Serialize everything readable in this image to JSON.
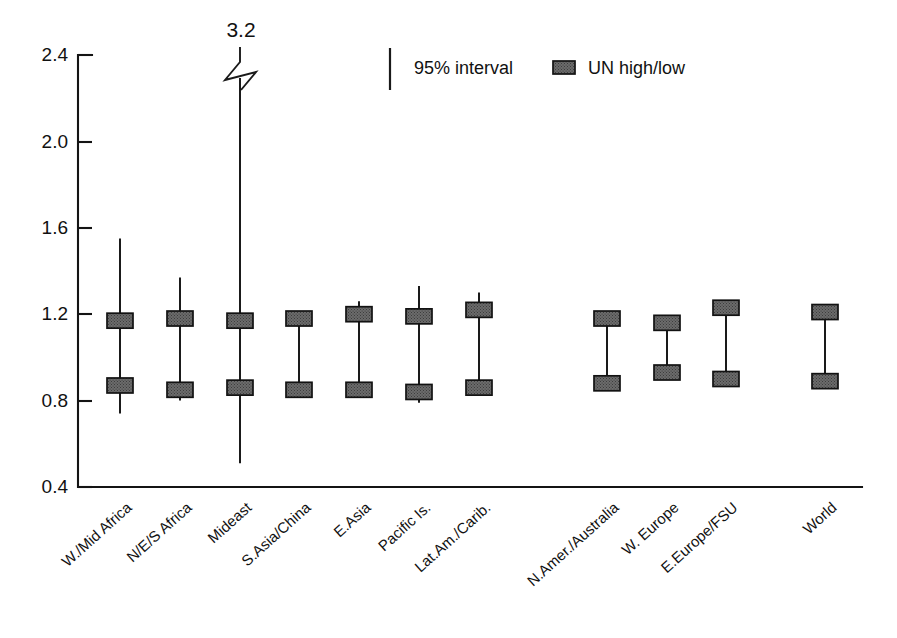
{
  "chart_data": {
    "type": "line",
    "title": "",
    "subtitle": "",
    "xlabel": "",
    "ylabel": "",
    "ylim": [
      0.4,
      2.4
    ],
    "yticks": [
      0.4,
      0.8,
      1.2,
      1.6,
      2.0,
      2.4
    ],
    "ytick_labels": [
      "0.4",
      "0.8",
      "1.2",
      "1.6",
      "2.0",
      "2.4"
    ],
    "grid": false,
    "legend_position": "top-center",
    "annotations": [
      {
        "text": "3.2",
        "category": "Mideast",
        "note": "upper end of 95% interval for Mideast, axis broken with zigzag symbol"
      }
    ],
    "categories": [
      "W./Mid Africa",
      "N/E/S Africa",
      "Mideast",
      "S.Asia/China",
      "E.Asia",
      "Pacific Is.",
      "Lat.Am./Carib.",
      "N.Amer./Australia",
      "W. Europe",
      "E.Europe/FSU",
      "World"
    ],
    "series": [
      {
        "name": "95% interval",
        "kind": "interval",
        "low": [
          0.74,
          0.8,
          0.51,
          0.83,
          0.83,
          0.79,
          0.83,
          0.87,
          0.93,
          0.9,
          0.89
        ],
        "high": [
          1.55,
          1.37,
          3.2,
          1.2,
          1.26,
          1.33,
          1.3,
          1.18,
          1.16,
          1.23,
          1.21
        ]
      },
      {
        "name": "UN high/low",
        "kind": "marker-pair",
        "un_low": [
          0.87,
          0.85,
          0.86,
          0.85,
          0.85,
          0.84,
          0.86,
          0.88,
          0.93,
          0.9,
          0.89
        ],
        "un_high": [
          1.17,
          1.18,
          1.17,
          1.18,
          1.2,
          1.19,
          1.22,
          1.18,
          1.16,
          1.23,
          1.21
        ]
      }
    ]
  },
  "legend": {
    "interval_label": "95% interval",
    "marker_label": "UN high/low"
  },
  "colors": {
    "marker_fill": "#6b6b6b",
    "marker_edge": "#121212",
    "line": "#1a1a1a",
    "axis": "#141414",
    "background": "#ffffff"
  },
  "icons": {
    "interval_rule": "vertical-rule-icon",
    "un_swatch": "filled-rectangle-swatch-icon",
    "axis_break": "zigzag-axis-break-icon"
  }
}
